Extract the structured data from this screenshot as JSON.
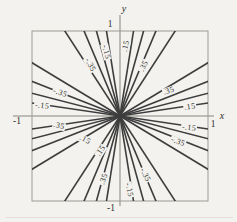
{
  "chart_data": {
    "type": "contour",
    "title": "",
    "xlabel": "x",
    "ylabel": "y",
    "xlim": [
      -1,
      1
    ],
    "ylim": [
      -1,
      1
    ],
    "grid": false,
    "levels_labeled": [
      0.15,
      0.35,
      -0.15,
      -0.35
    ],
    "levels_unlabeled": [
      0.25,
      0.45,
      -0.25,
      -0.45
    ],
    "line_slopes": [
      0.1535,
      0.2679,
      0.4084,
      0.627,
      1.595,
      2.449,
      3.732,
      6.513,
      -0.1535,
      -0.2679,
      -0.4084,
      -0.627,
      -1.595,
      -2.449,
      -3.732,
      -6.513
    ],
    "x_tick_labels": [
      {
        "text": "-1",
        "px": 17,
        "py": 121
      },
      {
        "text": "1",
        "px": 213,
        "py": 124
      }
    ],
    "y_tick_labels": [
      {
        "text": "1",
        "px": 110,
        "py": 24
      },
      {
        "text": "-1",
        "px": 111,
        "py": 208
      }
    ],
    "axis_names": [
      {
        "text": "x",
        "px": 222,
        "py": 116
      },
      {
        "text": "y",
        "px": 124,
        "py": 9
      }
    ],
    "contour_labels": [
      {
        "text": ".15",
        "px": 126,
        "py": 46,
        "rot": -78
      },
      {
        "text": ".35",
        "px": 144,
        "py": 66,
        "rot": -62
      },
      {
        "text": "-.15",
        "px": 106,
        "py": 52,
        "rot": 76
      },
      {
        "text": "-.35",
        "px": 90,
        "py": 65,
        "rot": 62
      },
      {
        "text": ".35",
        "px": 169,
        "py": 91,
        "rot": -19
      },
      {
        "text": ".15",
        "px": 190,
        "py": 107,
        "rot": -8
      },
      {
        "text": "-.35",
        "px": 60,
        "py": 93,
        "rot": 20
      },
      {
        "text": "-.15",
        "px": 42,
        "py": 106,
        "rot": 8
      },
      {
        "text": "-.15",
        "px": 189,
        "py": 128,
        "rot": 8
      },
      {
        "text": "-.35",
        "px": 178,
        "py": 142,
        "rot": 21
      },
      {
        "text": ".35",
        "px": 59,
        "py": 126,
        "rot": 12
      },
      {
        "text": ".15",
        "px": 85,
        "py": 140,
        "rot": 27
      },
      {
        "text": ".15",
        "px": 101,
        "py": 151,
        "rot": -56
      },
      {
        "text": ".35",
        "px": 104,
        "py": 179,
        "rot": -71
      },
      {
        "text": "-.35",
        "px": 145,
        "py": 175,
        "rot": 64
      },
      {
        "text": "-.15",
        "px": 129,
        "py": 190,
        "rot": 78
      }
    ]
  },
  "colors": {
    "background": "#f3f2ee",
    "contour_line": "#3d3d3d",
    "frame": "#9b9b94",
    "axis": "#85857e",
    "text": "#2e2e2a"
  }
}
